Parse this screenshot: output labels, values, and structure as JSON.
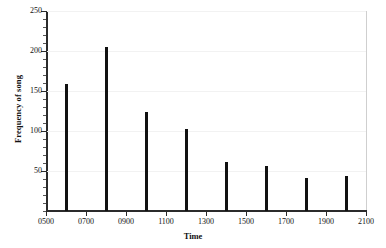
{
  "chart_data": {
    "type": "bar",
    "title": "",
    "subtitle": "",
    "xlabel": "Time",
    "ylabel": "Frequency of song",
    "categories": [
      "0600",
      "0800",
      "1000",
      "1200",
      "1400",
      "1600",
      "1800",
      "2000"
    ],
    "values": [
      159,
      205,
      124,
      103,
      61,
      56,
      41,
      44
    ],
    "series": [
      {
        "name": "Frequency of song",
        "values": [
          159,
          205,
          124,
          103,
          61,
          56,
          41,
          44
        ]
      }
    ],
    "xlim": [
      500,
      2100
    ],
    "ylim": [
      0,
      250
    ],
    "x_tick_labels": [
      "0500",
      "0700",
      "0900",
      "1100",
      "1300",
      "1500",
      "1700",
      "1900",
      "2100"
    ],
    "x_tick_values": [
      500,
      700,
      900,
      1100,
      1300,
      1500,
      1700,
      1900,
      2100
    ],
    "y_tick_labels": [
      "50",
      "100",
      "150",
      "200",
      "250"
    ],
    "y_tick_values": [
      50,
      100,
      150,
      200,
      250
    ],
    "y_minor_tick_step": 10,
    "grid": true,
    "legend": false,
    "legend_position": "none",
    "bar_color": "#111111",
    "axis_color": "#2b2b2b",
    "grid_color": "#f2f2f2",
    "background_color": "#ffffff",
    "annotations": []
  }
}
